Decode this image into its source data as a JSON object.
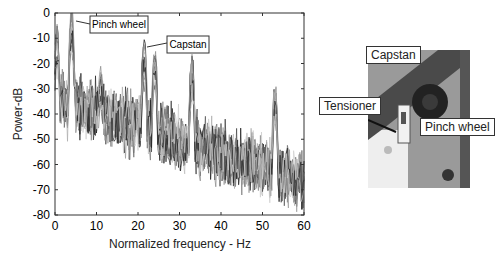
{
  "chart_data": {
    "type": "line",
    "title": "",
    "xlabel": "Normalized frequency - Hz",
    "ylabel": "Power-dB",
    "xlim": [
      0,
      60
    ],
    "ylim": [
      -80,
      0
    ],
    "xticks": [
      0,
      10,
      20,
      30,
      40,
      50,
      60
    ],
    "yticks": [
      0,
      -10,
      -20,
      -30,
      -40,
      -50,
      -60,
      -70,
      -80
    ],
    "grid": false,
    "legend": null,
    "annotations": [
      {
        "text": "Pinch wheel",
        "x": 4,
        "y": 0
      },
      {
        "text": "Capstan",
        "x": 21.5,
        "y": -12
      }
    ],
    "series_description": "Many overlaid grayscale power spectra",
    "peaks": [
      {
        "x": 0.5,
        "y": -7
      },
      {
        "x": 4,
        "y": 0
      },
      {
        "x": 4,
        "y": -6
      },
      {
        "x": 11,
        "y": -24
      },
      {
        "x": 21.5,
        "y": -12
      },
      {
        "x": 24,
        "y": -15
      },
      {
        "x": 33,
        "y": -18
      },
      {
        "x": 53,
        "y": -28
      }
    ]
  },
  "photo": {
    "labels": {
      "capstan": "Capstan",
      "tensioner": "Tensioner",
      "pinch_wheel": "Pinch wheel"
    }
  }
}
